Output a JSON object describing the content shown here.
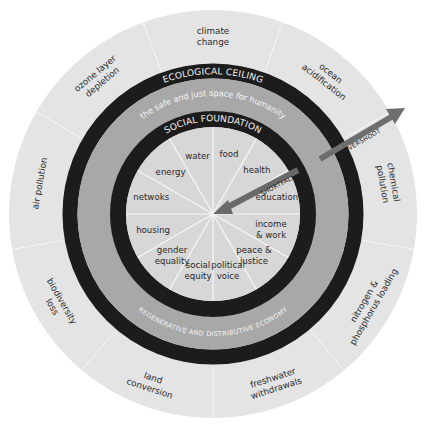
{
  "diagram": {
    "colors": {
      "outer_band": "#e4e4e4",
      "boundary_ring": "#1c1c1c",
      "safe_space_band": "#a8a8a8",
      "inner_disc": "#d7d7d7",
      "divider": "#f7f7f7",
      "overshoot_arrow": "#6e6e6e",
      "shortfall_arrow": "#6a6a6a",
      "ring_text": "#f2f2f2",
      "label_text": "#2a2a2a"
    },
    "rings": {
      "ecological_ceiling": "ECOLOGICAL CEILING",
      "safe_space": "the safe and just space for humanity",
      "social_foundation": "SOCIAL FOUNDATION",
      "economy": "REGENERATIVE AND DISTRIBUTIVE ECONOMY"
    },
    "arrows": {
      "overshoot": "OVERSHOOT",
      "shortfall": "SHORTFALL"
    },
    "ecological_ceiling_dimensions": [
      {
        "id": "climate",
        "lines": [
          "climate",
          "change"
        ]
      },
      {
        "id": "ocean",
        "lines": [
          "ocean",
          "acidification"
        ]
      },
      {
        "id": "chemical",
        "lines": [
          "chemical",
          "pollution"
        ]
      },
      {
        "id": "nitrogen",
        "lines": [
          "nitrogen &",
          "phosphorus loading"
        ]
      },
      {
        "id": "freshwater",
        "lines": [
          "freshwater",
          "withdrawals"
        ]
      },
      {
        "id": "land",
        "lines": [
          "land",
          "conversion"
        ]
      },
      {
        "id": "biodiversity",
        "lines": [
          "biodiversity",
          "loss"
        ]
      },
      {
        "id": "air",
        "lines": [
          "air pollution"
        ]
      },
      {
        "id": "ozone",
        "lines": [
          "ozone layer",
          "depletion"
        ]
      }
    ],
    "social_foundation_dimensions": [
      {
        "id": "food",
        "lines": [
          "food"
        ]
      },
      {
        "id": "health",
        "lines": [
          "health"
        ]
      },
      {
        "id": "education",
        "lines": [
          "education"
        ]
      },
      {
        "id": "income",
        "lines": [
          "income",
          "& work"
        ]
      },
      {
        "id": "peace",
        "lines": [
          "peace &",
          "justice"
        ]
      },
      {
        "id": "political",
        "lines": [
          "political",
          "voice"
        ]
      },
      {
        "id": "social-equity",
        "lines": [
          "social",
          "equity"
        ]
      },
      {
        "id": "gender",
        "lines": [
          "gender",
          "equality"
        ]
      },
      {
        "id": "housing",
        "lines": [
          "housing"
        ]
      },
      {
        "id": "networks",
        "lines": [
          "netwoks"
        ]
      },
      {
        "id": "energy",
        "lines": [
          "energy"
        ]
      },
      {
        "id": "water",
        "lines": [
          "water"
        ]
      }
    ]
  }
}
